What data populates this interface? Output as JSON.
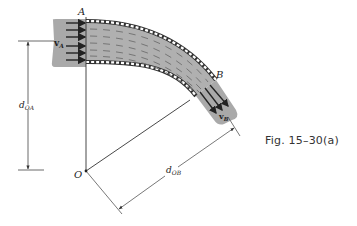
{
  "figure": {
    "caption": "Fig. 15–30(a)",
    "labels": {
      "point_a": "A",
      "point_b": "B",
      "origin": "O",
      "velocity_a": "v",
      "velocity_a_sub": "A",
      "velocity_b": "v",
      "velocity_b_sub": "B",
      "dist_oa": "d",
      "dist_oa_sub": "OA",
      "dist_ob": "d",
      "dist_ob_sub": "OB"
    },
    "colors": {
      "fluid": "#a9a9a9",
      "pipe_wall": "#333333",
      "lines": "#333333",
      "background": "#ffffff"
    }
  }
}
